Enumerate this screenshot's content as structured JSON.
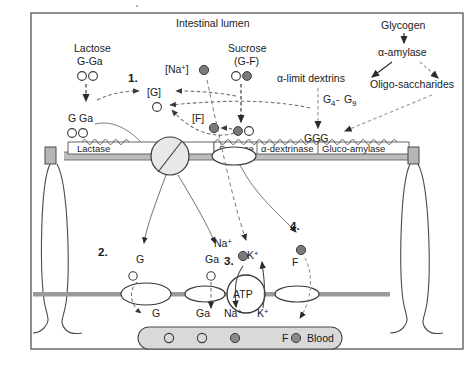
{
  "figure": {
    "title": "Intestinal lumen",
    "speck_note": ""
  },
  "lumen": {
    "lactose": {
      "name": "Lactose",
      "formula": "G-Ga"
    },
    "sucrose": {
      "name": "Sucrose",
      "formula": "(G-F)"
    },
    "glycogen": {
      "name": "Glycogen"
    },
    "amylase": {
      "name": "α-amylase"
    },
    "alpha_limit_dextrins": {
      "name": "α-limit dextrins",
      "range": "G4 - G9",
      "range_base": "G",
      "sub_lo": "4",
      "sub_hi": "9",
      "dash": " - "
    },
    "oligosaccharides": {
      "name": "Oligo-saccharides"
    },
    "ggg": {
      "name": "GGG"
    },
    "products": {
      "g_ga": "G Ga"
    }
  },
  "brackets": {
    "na": "[Na",
    "na_sup": "+",
    "na_close": "]",
    "g": "[G]",
    "f": "[F]"
  },
  "enzymes": [
    {
      "id": "lactase",
      "label": "Lactase"
    },
    {
      "id": "sucrase",
      "label": "Sucrase"
    },
    {
      "id": "alpha-dextrinase",
      "label": "α-dextrinase"
    },
    {
      "id": "gluco-amylase",
      "label": "Gluco-amylase"
    }
  ],
  "steps": [
    {
      "num": "1."
    },
    {
      "num": "2."
    },
    {
      "num": "3."
    },
    {
      "num": "4."
    }
  ],
  "cytosol": {
    "glucose": "G",
    "galactose": "Ga",
    "sodium": "Na",
    "sodium_sup": "+",
    "potassium": "K",
    "potassium_sup": "+",
    "fructose": "F",
    "atp": "ATP"
  },
  "basolateral": {
    "glucose_out": "G",
    "galactose_out": "Ga",
    "sodium_out": "Na",
    "sodium_out_sup": "+",
    "potassium_in": "K",
    "potassium_in_sup": "+",
    "fructose_out": "F"
  },
  "blood": {
    "label": "Blood"
  },
  "colors": {
    "ink": "#1a1a1a",
    "line": "#555555",
    "dashed": "#6f6f6f",
    "filled_circle": "#7a7a7a",
    "open_circle_fill": "#ffffff",
    "membrane": "#9a9a9a",
    "blood_fill": "#d9d9d9",
    "junction_fill": "#b5b5b5",
    "border": "#555555",
    "transporter_fill": "#e8e8e8"
  }
}
